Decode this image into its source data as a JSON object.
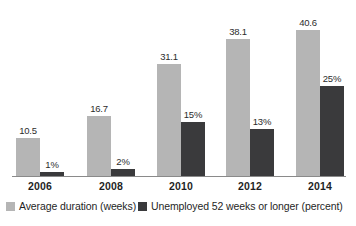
{
  "chart_data": {
    "type": "bar",
    "title": "",
    "subtitle": "",
    "xlabel": "",
    "ylabel": "",
    "grid": false,
    "legend_position": "bottom",
    "categories": [
      "2006",
      "2008",
      "2010",
      "2012",
      "2014"
    ],
    "ylim": [
      0,
      45
    ],
    "series": [
      {
        "name": "Average duration (weeks)",
        "color": "#b5b5b5",
        "values": [
          10.5,
          16.7,
          31.1,
          38.1,
          40.6
        ],
        "labels": [
          "10.5",
          "16.7",
          "31.1",
          "38.1",
          "40.6"
        ]
      },
      {
        "name": "Unemployed 52 weeks or longer (percent)",
        "color": "#3a3a3c",
        "values": [
          1,
          2,
          15,
          13,
          25
        ],
        "labels": [
          "1%",
          "2%",
          "15%",
          "13%",
          "25%"
        ]
      }
    ]
  },
  "axis": {
    "tick_labels": [
      "2006",
      "2008",
      "2010",
      "2012",
      "2014"
    ]
  },
  "legend": {
    "items": [
      {
        "label": "Average duration (weeks)",
        "color": "#b5b5b5"
      },
      {
        "label": "Unemployed 52 weeks or longer (percent)",
        "color": "#3a3a3c"
      }
    ]
  },
  "colors": {
    "series_a": "#b5b5b5",
    "series_b": "#3a3a3c",
    "axis": "#8a8a8a",
    "text": "#1f1f1f",
    "background": "#ffffff"
  }
}
